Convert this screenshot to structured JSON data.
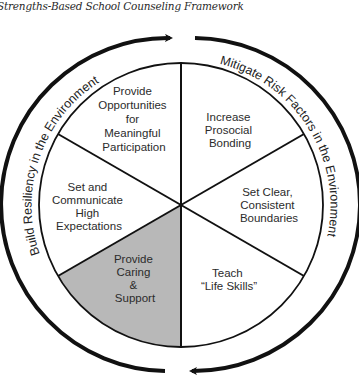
{
  "title": "Strengths-Based School Counseling Framework",
  "ring": {
    "left_label": "Build Resiliency in the Environment",
    "right_label": "Mitigate Risk Factors in the Environment"
  },
  "sectors": [
    {
      "id": "top-left",
      "lines": [
        "Provide",
        "Opportunities",
        "for",
        "Meaningful",
        "Participation"
      ],
      "shaded": false
    },
    {
      "id": "top-right",
      "lines": [
        "Increase",
        "Prosocial",
        "Bonding"
      ],
      "shaded": false
    },
    {
      "id": "right",
      "lines": [
        "Set Clear,",
        "Consistent",
        "Boundaries"
      ],
      "shaded": false
    },
    {
      "id": "bottom-right",
      "lines": [
        "Teach",
        "“Life Skills”"
      ],
      "shaded": false
    },
    {
      "id": "bottom-left",
      "lines": [
        "Provide",
        "Caring",
        "&",
        "Support"
      ],
      "shaded": true
    },
    {
      "id": "left",
      "lines": [
        "Set and",
        "Communicate",
        "High",
        "Expectations"
      ],
      "shaded": false
    }
  ],
  "colors": {
    "shaded_sector": "#b8b8b8",
    "stroke": "#111111"
  }
}
